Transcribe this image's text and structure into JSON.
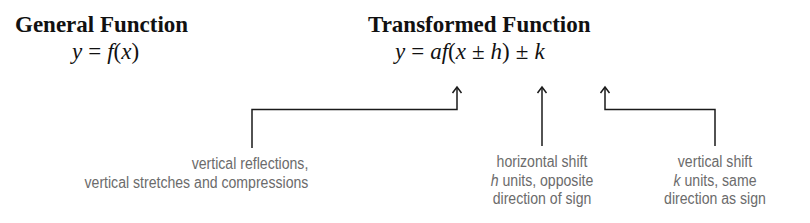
{
  "general": {
    "heading": "General Function",
    "formula": {
      "lhs": "y",
      "eq": "=",
      "rhs_func": "f",
      "rhs_arg": "(x)"
    }
  },
  "transformed": {
    "heading": "Transformed Function",
    "formula": {
      "lhs": "y",
      "eq": "=",
      "a": "a",
      "f": "f",
      "open": "(",
      "x": "x",
      "pm1": "±",
      "h": "h",
      "close": ")",
      "pm2": "±",
      "k": "k"
    }
  },
  "annotations": [
    {
      "target": "a",
      "lines": [
        "vertical reflections,",
        "vertical stretches and compressions"
      ]
    },
    {
      "target": "h",
      "var": "h",
      "lines": [
        "horizontal shift",
        " units, opposite",
        "direction of sign"
      ]
    },
    {
      "target": "k",
      "var": "k",
      "lines": [
        "vertical shift",
        " units, same",
        "direction as sign"
      ]
    }
  ],
  "colors": {
    "text": "#111111",
    "label": "#6b6b6b",
    "line": "#1a1a1a"
  }
}
